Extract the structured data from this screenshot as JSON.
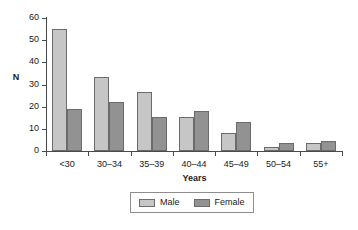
{
  "chart_data": {
    "type": "bar",
    "title": "",
    "xlabel": "Years",
    "ylabel": "N",
    "ylim": [
      0,
      60
    ],
    "yticks": [
      0,
      10,
      20,
      30,
      40,
      50,
      60
    ],
    "grid": false,
    "legend_position": "bottom-center",
    "categories": [
      "<30",
      "30–34",
      "35–39",
      "40–44",
      "45–49",
      "50–54",
      "55+"
    ],
    "series": [
      {
        "name": "Male",
        "color": "#c6c6c6",
        "values": [
          55,
          33.5,
          26.5,
          15.5,
          8,
          2,
          3.5
        ]
      },
      {
        "name": "Female",
        "color": "#929292",
        "values": [
          19,
          22,
          15.5,
          18,
          13,
          3.5,
          4.5
        ]
      }
    ]
  },
  "legend": {
    "entries": [
      {
        "label": "Male"
      },
      {
        "label": "Female"
      }
    ]
  },
  "colors": {
    "male": "#c6c6c6",
    "female": "#929292",
    "axis": "#4a4a4a",
    "bar_border": "#6b6b6b",
    "legend_border": "#8d8d8d",
    "background": "#ffffff"
  }
}
